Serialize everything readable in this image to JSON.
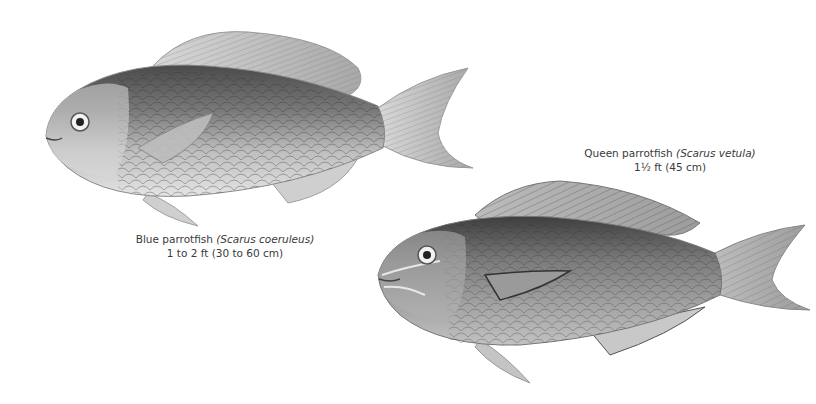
{
  "plate": {
    "background": "#ffffff",
    "ink": "#3a3a3a"
  },
  "species": [
    {
      "id": "blue-parrotfish",
      "common_name": "Blue parrotfish",
      "scientific_name": "(Scarus coeruleus)",
      "size": "1 to 2 ft (30 to 60 cm)",
      "illustration": "fish-illustration"
    },
    {
      "id": "queen-parrotfish",
      "common_name": "Queen parrotfish",
      "scientific_name": "(Scarus vetula)",
      "size": "1½ ft (45 cm)",
      "illustration": "fish-illustration"
    }
  ]
}
